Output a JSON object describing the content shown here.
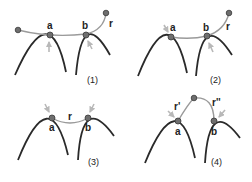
{
  "panels": [
    {
      "id": "1",
      "caption": "(1)",
      "labels": {
        "a": "a",
        "b": "b",
        "r": "r"
      },
      "description": "r attached from left through a and b, extending up-right; arrows from below at a and b"
    },
    {
      "id": "2",
      "caption": "(2)",
      "labels": {
        "a": "a",
        "b": "b",
        "r": "r"
      },
      "description": "r from a through b up-right; arrow at a from upper-left, arrow at b from below"
    },
    {
      "id": "3",
      "caption": "(3)",
      "labels": {
        "a": "a",
        "b": "b",
        "r": "r"
      },
      "description": "r spans directly between a and b; arrows from above at a and b"
    },
    {
      "id": "4",
      "caption": "(4)",
      "labels": {
        "a": "a",
        "b": "b",
        "r1": "r'",
        "r2": "r''"
      },
      "description": "r' from a to a top node, r'' from top node to b; arrows from sides at a and b"
    }
  ],
  "colors": {
    "curve": "#2a2a2a",
    "connector": "#9a9a9a",
    "node": "#6e6e6e",
    "arrow": "#b8b8b8"
  }
}
